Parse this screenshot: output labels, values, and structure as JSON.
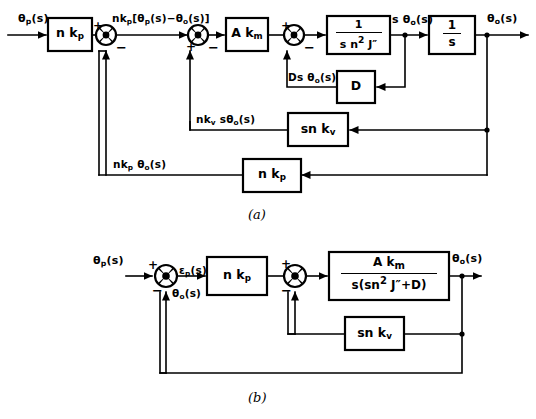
{
  "figure": {
    "captions": {
      "a": "(a)",
      "b": "(b)"
    }
  },
  "diagram_a": {
    "signals": {
      "input": "θp(s)",
      "after_first_sum": "nkp[θp(s)−θo(s)]",
      "after_plant": "s θo(s)",
      "output": "θo(s)",
      "damping_feedback": "Ds θo(s)",
      "velocity_feedback": "nkv sθo(s)",
      "position_feedback": "nkp θo(s)"
    },
    "blocks": [
      {
        "id": "nkp_forward",
        "label": "n kp"
      },
      {
        "id": "akm",
        "label": "A km"
      },
      {
        "id": "plant",
        "label_num": "1",
        "label_den": "s n2 J″"
      },
      {
        "id": "integrator",
        "label_num": "1",
        "label_den": "s"
      },
      {
        "id": "damping",
        "label": "D"
      },
      {
        "id": "snkv",
        "label": "sn kv"
      },
      {
        "id": "nkp_feedback",
        "label": "n kp"
      }
    ],
    "summing_junctions": [
      {
        "id": "sum1",
        "signs": {
          "in": "+",
          "fb": "−"
        }
      },
      {
        "id": "sum2",
        "signs": {
          "in": "+",
          "fb": "−"
        }
      },
      {
        "id": "sum3",
        "signs": {
          "in": "+",
          "fb": "−"
        }
      }
    ]
  },
  "diagram_b": {
    "signals": {
      "input": "θp(s)",
      "error": "εp(s)",
      "feedback": "θo(s)",
      "output": "θo(s)"
    },
    "blocks": [
      {
        "id": "nkp_forward_b",
        "label": "n kp"
      },
      {
        "id": "plant_b",
        "label_num": "A km",
        "label_den": "s(sn2 J″+D)"
      },
      {
        "id": "snkv_b",
        "label": "sn kv"
      }
    ],
    "summing_junctions": [
      {
        "id": "sum1b",
        "signs": {
          "in": "+",
          "fb": "−"
        }
      },
      {
        "id": "sum2b",
        "signs": {
          "in": "+",
          "fb": "−"
        }
      }
    ]
  }
}
